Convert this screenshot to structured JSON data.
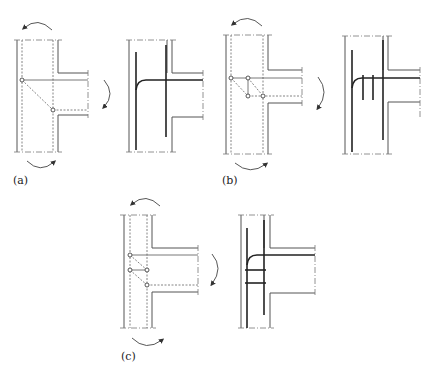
{
  "figure": {
    "panels": [
      {
        "id": "a",
        "label": "(a)",
        "model": "single diagonal strut",
        "nodes": 2,
        "reinforcement": "beam top bar hooked down into column"
      },
      {
        "id": "b",
        "label": "(b)",
        "model": "two diagonal struts with vertical tie",
        "nodes": 4,
        "reinforcement": "hooked beam bar with two vertical stirrups"
      },
      {
        "id": "c",
        "label": "(c)",
        "model": "two diagonal struts with horizontal tie",
        "nodes": 4,
        "reinforcement": "hooked beam bar with two horizontal ties"
      }
    ]
  },
  "colors": {
    "line": "#555555",
    "rebar": "#222222",
    "background": "#ffffff"
  }
}
